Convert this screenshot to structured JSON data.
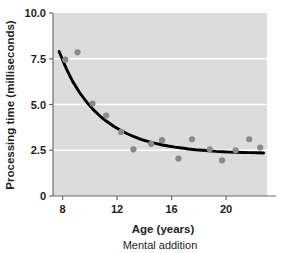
{
  "figure": {
    "caption": "Mental addition",
    "background_color": "#ffffff",
    "plot_background_color": "#dcdcdc",
    "gridline_color": "#ffffff",
    "axis_color": "#6b6b6b",
    "curve_color": "#000000",
    "point_color": "#8a8a8a"
  },
  "chart_data": {
    "type": "scatter",
    "title": "",
    "subtitle": "",
    "xlabel": "Age (years)",
    "ylabel": "Processing time (milliseconds)",
    "xlim": [
      7.3,
      23.0
    ],
    "ylim": [
      0,
      10.0
    ],
    "xticks": [
      8,
      12,
      16,
      20
    ],
    "xtick_labels": [
      "8",
      "12",
      "16",
      "20"
    ],
    "yticks": [
      0,
      2.5,
      5.0,
      7.5,
      10.0
    ],
    "ytick_labels": [
      "0",
      "2.5",
      "5.0",
      "7.5",
      "10.0"
    ],
    "grid": true,
    "grid_axis": "y",
    "legend": false,
    "legend_position": "none",
    "annotation": "Mental addition",
    "series": [
      {
        "name": "Observed processing time",
        "type": "scatter",
        "marker": "circle",
        "color": "#8a8a8a",
        "points": [
          {
            "x": 8.2,
            "y": 7.45
          },
          {
            "x": 9.1,
            "y": 7.85
          },
          {
            "x": 10.2,
            "y": 5.05
          },
          {
            "x": 11.2,
            "y": 4.4
          },
          {
            "x": 12.3,
            "y": 3.5
          },
          {
            "x": 13.2,
            "y": 2.55
          },
          {
            "x": 14.5,
            "y": 2.85
          },
          {
            "x": 15.3,
            "y": 3.05
          },
          {
            "x": 16.5,
            "y": 2.05
          },
          {
            "x": 17.5,
            "y": 3.1
          },
          {
            "x": 18.8,
            "y": 2.55
          },
          {
            "x": 19.7,
            "y": 1.95
          },
          {
            "x": 20.7,
            "y": 2.5
          },
          {
            "x": 21.7,
            "y": 3.1
          },
          {
            "x": 22.5,
            "y": 2.65
          }
        ]
      },
      {
        "name": "Fitted decay curve",
        "type": "line",
        "color": "#000000",
        "points": [
          {
            "x": 7.75,
            "y": 7.9
          },
          {
            "x": 8.25,
            "y": 7.0
          },
          {
            "x": 8.75,
            "y": 6.25
          },
          {
            "x": 9.25,
            "y": 5.65
          },
          {
            "x": 9.75,
            "y": 5.15
          },
          {
            "x": 10.25,
            "y": 4.72
          },
          {
            "x": 10.75,
            "y": 4.37
          },
          {
            "x": 11.25,
            "y": 4.07
          },
          {
            "x": 11.75,
            "y": 3.81
          },
          {
            "x": 12.25,
            "y": 3.59
          },
          {
            "x": 12.75,
            "y": 3.4
          },
          {
            "x": 13.25,
            "y": 3.24
          },
          {
            "x": 13.75,
            "y": 3.1
          },
          {
            "x": 14.25,
            "y": 2.99
          },
          {
            "x": 14.75,
            "y": 2.89
          },
          {
            "x": 15.25,
            "y": 2.8
          },
          {
            "x": 15.75,
            "y": 2.73
          },
          {
            "x": 16.25,
            "y": 2.67
          },
          {
            "x": 16.75,
            "y": 2.62
          },
          {
            "x": 17.25,
            "y": 2.57
          },
          {
            "x": 17.75,
            "y": 2.53
          },
          {
            "x": 18.25,
            "y": 2.5
          },
          {
            "x": 18.75,
            "y": 2.47
          },
          {
            "x": 19.25,
            "y": 2.44
          },
          {
            "x": 19.75,
            "y": 2.42
          },
          {
            "x": 20.25,
            "y": 2.4
          },
          {
            "x": 20.75,
            "y": 2.39
          },
          {
            "x": 21.25,
            "y": 2.38
          },
          {
            "x": 21.75,
            "y": 2.37
          },
          {
            "x": 22.25,
            "y": 2.36
          },
          {
            "x": 22.75,
            "y": 2.35
          }
        ]
      }
    ]
  }
}
